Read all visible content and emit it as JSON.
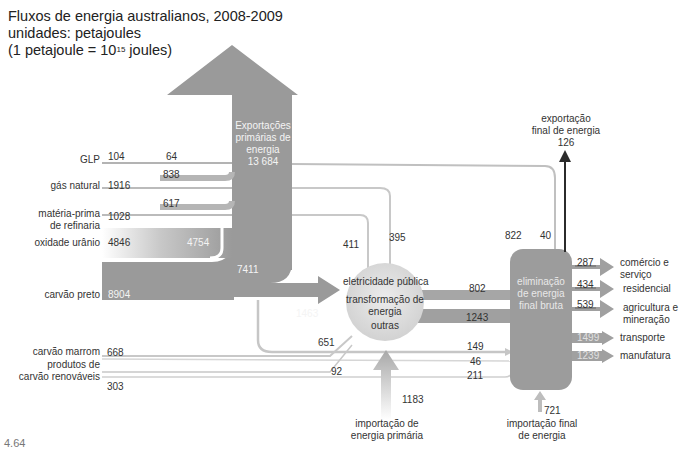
{
  "title": {
    "line1": "Fluxos de energia australianos, 2008-2009",
    "line2": "unidades: petajoules",
    "line3_prefix": "(1 petajoule = 10",
    "line3_exp": "15",
    "line3_suffix": " joules)"
  },
  "figure_number": "4.64",
  "sources": {
    "glp": {
      "label": "GLP",
      "value": "104",
      "to_refinery": "64"
    },
    "gas_natural": {
      "label": "gás natural",
      "value": "1916",
      "to_export": "838"
    },
    "materia_prima": {
      "label1": "matéria-prima",
      "label2": "de refinaria",
      "value": "1028",
      "to_export": "617"
    },
    "uranio": {
      "label": "oxidade urânio",
      "value": "4846",
      "to_export": "4754"
    },
    "carvao_preto": {
      "label": "carvão preto",
      "value": "8904",
      "to_export": "7411",
      "to_transform": "1463"
    },
    "carvao_marrom": {
      "label": "carvão marrom",
      "value": "668"
    },
    "renovaveis": {
      "label1": "produtos de",
      "label2": "carvão renováveis",
      "value": "303"
    }
  },
  "exports": {
    "primary": {
      "line1": "Exportações",
      "line2": "primárias de",
      "line3": "energia",
      "value": "13 684"
    },
    "final": {
      "line1": "exportação",
      "line2": "final de energia",
      "value": "126"
    }
  },
  "transformation": {
    "top": "eletricidade pública",
    "mid1": "transformação de",
    "mid2": "energia",
    "bottom": "outras",
    "in_411": "411",
    "in_395": "395",
    "in_651": "651",
    "in_92": "92",
    "out_802": "802",
    "out_1243": "1243"
  },
  "bypass": {
    "v149": "149",
    "v46": "46",
    "v211": "211",
    "v822": "822",
    "v40": "40"
  },
  "imports": {
    "primary": {
      "value": "1183",
      "line1": "importação de",
      "line2": "energia primária"
    },
    "final": {
      "value": "721",
      "line1": "importação final",
      "line2": "de energia"
    }
  },
  "final_use": {
    "box": {
      "line1": "eliminação",
      "line2": "de energia",
      "line3": "final bruta"
    },
    "outputs": [
      {
        "value": "287",
        "label1": "comércio e",
        "label2": "serviço"
      },
      {
        "value": "434",
        "label1": "residencial",
        "label2": ""
      },
      {
        "value": "539",
        "label1": "agricultura e",
        "label2": "mineração"
      },
      {
        "value": "1499",
        "label1": "transporte",
        "label2": ""
      },
      {
        "value": "1239",
        "label1": "manufatura",
        "label2": ""
      }
    ]
  },
  "colors": {
    "flow": "#9a9a9a",
    "flow_light": "#c4c4c4",
    "line": "#b8b8b8",
    "export_arrow": "#2b2b2b",
    "circle": "#dcdcdc"
  }
}
